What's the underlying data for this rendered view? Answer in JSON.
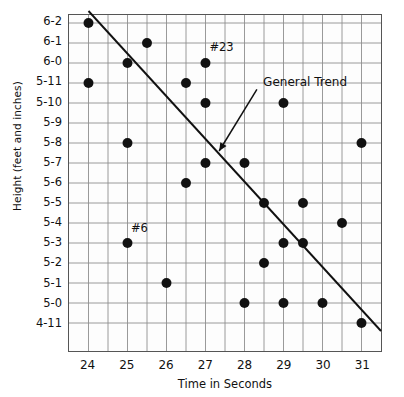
{
  "chart_data": {
    "type": "scatter",
    "title": "",
    "xlabel": "Time in Seconds",
    "ylabel": "Height (feet and inches)",
    "xlim": [
      23.5,
      31.5
    ],
    "ylim": [
      0,
      16
    ],
    "grid": true,
    "legend_position": "none",
    "x_ticks": [
      "24",
      "25",
      "26",
      "27",
      "28",
      "29",
      "30",
      "31"
    ],
    "x_tick_values": [
      24,
      25,
      26,
      27,
      28,
      29,
      30,
      31
    ],
    "x_minor_step": 0.5,
    "y_ticks": [
      "6-2",
      "6-1",
      "6-0",
      "5-11",
      "5-10",
      "5-9",
      "5-8",
      "5-7",
      "5-6",
      "5-5",
      "5-4",
      "5-3",
      "5-2",
      "5-1",
      "5-0",
      "4-11"
    ],
    "y_tick_inches": [
      74,
      73,
      72,
      71,
      70,
      69,
      68,
      67,
      66,
      65,
      64,
      63,
      62,
      61,
      60,
      59
    ],
    "points": [
      {
        "x": 24.0,
        "y": "6-2",
        "y_inches": 74
      },
      {
        "x": 25.5,
        "y": "6-1",
        "y_inches": 73
      },
      {
        "x": 25.0,
        "y": "6-0",
        "y_inches": 72
      },
      {
        "x": 27.0,
        "y": "6-0",
        "y_inches": 72,
        "label": "#23"
      },
      {
        "x": 24.0,
        "y": "5-11",
        "y_inches": 71
      },
      {
        "x": 26.5,
        "y": "5-11",
        "y_inches": 71
      },
      {
        "x": 27.0,
        "y": "5-10",
        "y_inches": 70
      },
      {
        "x": 29.0,
        "y": "5-10",
        "y_inches": 70
      },
      {
        "x": 25.0,
        "y": "5-8",
        "y_inches": 68
      },
      {
        "x": 31.0,
        "y": "5-8",
        "y_inches": 68
      },
      {
        "x": 27.0,
        "y": "5-7",
        "y_inches": 67
      },
      {
        "x": 28.0,
        "y": "5-7",
        "y_inches": 67
      },
      {
        "x": 26.5,
        "y": "5-6",
        "y_inches": 66
      },
      {
        "x": 28.5,
        "y": "5-5",
        "y_inches": 65
      },
      {
        "x": 29.5,
        "y": "5-5",
        "y_inches": 65
      },
      {
        "x": 30.5,
        "y": "5-4",
        "y_inches": 64
      },
      {
        "x": 25.0,
        "y": "5-3",
        "y_inches": 63,
        "label": "#6"
      },
      {
        "x": 29.0,
        "y": "5-3",
        "y_inches": 63
      },
      {
        "x": 29.5,
        "y": "5-3",
        "y_inches": 63
      },
      {
        "x": 28.5,
        "y": "5-2",
        "y_inches": 62
      },
      {
        "x": 26.0,
        "y": "5-1",
        "y_inches": 61
      },
      {
        "x": 28.0,
        "y": "5-0",
        "y_inches": 60
      },
      {
        "x": 29.0,
        "y": "5-0",
        "y_inches": 60
      },
      {
        "x": 30.0,
        "y": "5-0",
        "y_inches": 60
      },
      {
        "x": 31.0,
        "y": "4-11",
        "y_inches": 59
      }
    ],
    "trend_line": {
      "label": "General Trend",
      "x_start": 24.0,
      "y_start_inches": 74.6,
      "x_end": 31.5,
      "y_end_inches": 58.6
    },
    "annotations": [
      {
        "text": "General Trend",
        "kind": "callout",
        "target_x": 27.35,
        "target_y_inches": 67.6
      },
      {
        "text": "#23",
        "kind": "point-label",
        "point_x": 27.0,
        "point_y": "6-0"
      },
      {
        "text": "#6",
        "kind": "point-label",
        "point_x": 25.0,
        "point_y": "5-3"
      }
    ],
    "style": {
      "point_color": "#111111",
      "point_radius_px": 5,
      "grid_color": "#8e8e8e",
      "frame_color": "#555555",
      "trend_color": "#111111",
      "background": "#fdfdfd"
    }
  }
}
